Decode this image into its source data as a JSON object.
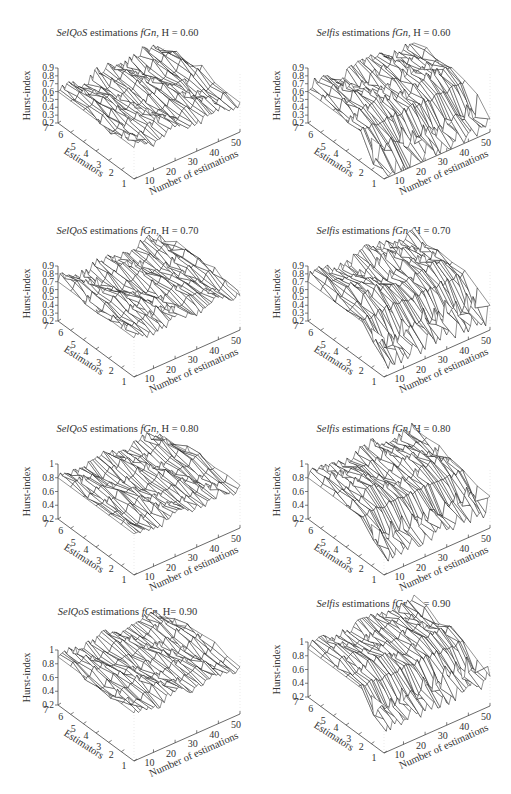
{
  "figure": {
    "common": {
      "zlabel": "Hurst-index",
      "ylabel": "Estimators",
      "xlabel": "Number of estimations",
      "x_ticks": [
        "10",
        "20",
        "30",
        "40",
        "50"
      ],
      "y_ticks": [
        "1",
        "2",
        "3",
        "4",
        "5",
        "6",
        "7"
      ],
      "title_suffix": "estimations",
      "title_series": "fGn",
      "title_h_prefix": "H"
    }
  },
  "panels": [
    {
      "id": "selqos-060",
      "tool": "SelQoS",
      "title_rest": " estimations ",
      "series": "fGn",
      "h_label": "H = 0.60",
      "z_ticks": [
        "0.2",
        "0.3",
        "0.4",
        "0.5",
        "0.6",
        "0.7",
        "0.8",
        "0.9"
      ]
    },
    {
      "id": "selfis-060",
      "tool": "Selfis",
      "title_rest": " estimations ",
      "series": "fGn",
      "h_label": "H = 0.60",
      "z_ticks": [
        "0.2",
        "0.3",
        "0.4",
        "0.5",
        "0.6",
        "0.7",
        "0.8",
        "0.9"
      ]
    },
    {
      "id": "selqos-070",
      "tool": "SelQoS",
      "title_rest": " estimations ",
      "series": "fGn",
      "h_label": "H = 0.70",
      "z_ticks": [
        "0.2",
        "0.3",
        "0.4",
        "0.5",
        "0.6",
        "0.7",
        "0.8",
        "0.9"
      ]
    },
    {
      "id": "selfis-070",
      "tool": "Selfis",
      "title_rest": " estimations ",
      "series": "fGn",
      "h_label": "H = 0.70",
      "z_ticks": [
        "0.2",
        "0.3",
        "0.4",
        "0.5",
        "0.6",
        "0.7",
        "0.8",
        "0.9"
      ]
    },
    {
      "id": "selqos-080",
      "tool": "SelQoS",
      "title_rest": " estimations ",
      "series": "fGn",
      "h_label": "H = 0.80",
      "z_ticks": [
        "0.2",
        "0.4",
        "0.6",
        "0.8",
        "1"
      ]
    },
    {
      "id": "selfis-080",
      "tool": "Selfis",
      "title_rest": " estimations ",
      "series": "fGn",
      "h_label": "H = 0.80",
      "z_ticks": [
        "0.2",
        "0.4",
        "0.6",
        "0.8",
        "1"
      ]
    },
    {
      "id": "selqos-090",
      "tool": "SelQoS",
      "title_rest": " estimations ",
      "series": "fGn",
      "h_label": "H= 0.90",
      "z_ticks": [
        "0.2",
        "0.4",
        "0.6",
        "0.8",
        "1"
      ]
    },
    {
      "id": "selfis-090",
      "tool": "Selfis",
      "title_rest": " estimations ",
      "series": "fGn",
      "h_label": "H = 0.90",
      "z_ticks": [
        "0.2",
        "0.4",
        "0.6",
        "0.8",
        "1"
      ]
    }
  ],
  "chart_data": [
    {
      "type": "surface",
      "title": "SelQoS estimations fGn, H = 0.60",
      "xlabel": "Number of estimations",
      "ylabel": "Estimators",
      "zlabel": "Hurst-index",
      "x_range": [
        1,
        50
      ],
      "x_ticks": [
        10,
        20,
        30,
        40,
        50
      ],
      "y_range": [
        1,
        7
      ],
      "y_ticks": [
        1,
        2,
        3,
        4,
        5,
        6,
        7
      ],
      "zlim": [
        0.2,
        0.9
      ],
      "z_ticks": [
        0.2,
        0.3,
        0.4,
        0.5,
        0.6,
        0.7,
        0.8,
        0.9
      ],
      "true_H": 0.6,
      "surface_level_approx": 0.6,
      "variation_approx": 0.08,
      "description": "Near-flat wireframe around 0.6 across all 7 estimators and 50 estimations"
    },
    {
      "type": "surface",
      "title": "Selfis estimations fGn, H = 0.60",
      "xlabel": "Number of estimations",
      "ylabel": "Estimators",
      "zlabel": "Hurst-index",
      "x_range": [
        1,
        50
      ],
      "x_ticks": [
        10,
        20,
        30,
        40,
        50
      ],
      "y_range": [
        1,
        7
      ],
      "y_ticks": [
        1,
        2,
        3,
        4,
        5,
        6,
        7
      ],
      "zlim": [
        0.2,
        0.9
      ],
      "z_ticks": [
        0.2,
        0.3,
        0.4,
        0.5,
        0.6,
        0.7,
        0.8,
        0.9
      ],
      "true_H": 0.6,
      "surface_level_approx": 0.6,
      "low_estimator_dip_approx": 0.2,
      "description": "Surface near 0.6 for estimators 3-7; estimators 1-2 drop sharply with spiky values down to ~0.2"
    },
    {
      "type": "surface",
      "title": "SelQoS estimations fGn, H = 0.70",
      "xlabel": "Number of estimations",
      "ylabel": "Estimators",
      "zlabel": "Hurst-index",
      "x_range": [
        1,
        50
      ],
      "x_ticks": [
        10,
        20,
        30,
        40,
        50
      ],
      "y_range": [
        1,
        7
      ],
      "y_ticks": [
        1,
        2,
        3,
        4,
        5,
        6,
        7
      ],
      "zlim": [
        0.2,
        0.9
      ],
      "z_ticks": [
        0.2,
        0.3,
        0.4,
        0.5,
        0.6,
        0.7,
        0.8,
        0.9
      ],
      "true_H": 0.7,
      "surface_level_approx": 0.7,
      "variation_approx": 0.08,
      "description": "Near-flat wireframe around 0.7"
    },
    {
      "type": "surface",
      "title": "Selfis estimations fGn, H = 0.70",
      "xlabel": "Number of estimations",
      "ylabel": "Estimators",
      "zlabel": "Hurst-index",
      "x_range": [
        1,
        50
      ],
      "x_ticks": [
        10,
        20,
        30,
        40,
        50
      ],
      "y_range": [
        1,
        7
      ],
      "y_ticks": [
        1,
        2,
        3,
        4,
        5,
        6,
        7
      ],
      "zlim": [
        0.2,
        0.9
      ],
      "z_ticks": [
        0.2,
        0.3,
        0.4,
        0.5,
        0.6,
        0.7,
        0.8,
        0.9
      ],
      "true_H": 0.7,
      "surface_level_approx": 0.7,
      "low_estimator_dip_approx": 0.25,
      "description": "Surface near 0.7; estimators 1-2 spike down to ~0.25"
    },
    {
      "type": "surface",
      "title": "SelQoS estimations fGn, H = 0.80",
      "xlabel": "Number of estimations",
      "ylabel": "Estimators",
      "zlabel": "Hurst-index",
      "x_range": [
        1,
        50
      ],
      "x_ticks": [
        10,
        20,
        30,
        40,
        50
      ],
      "y_range": [
        1,
        7
      ],
      "y_ticks": [
        1,
        2,
        3,
        4,
        5,
        6,
        7
      ],
      "zlim": [
        0.2,
        1.0
      ],
      "z_ticks": [
        0.2,
        0.4,
        0.6,
        0.8,
        1.0
      ],
      "true_H": 0.8,
      "surface_level_approx": 0.8,
      "variation_approx": 0.1,
      "description": "Near-flat wireframe around 0.8"
    },
    {
      "type": "surface",
      "title": "Selfis estimations fGn, H = 0.80",
      "xlabel": "Number of estimations",
      "ylabel": "Estimators",
      "zlabel": "Hurst-index",
      "x_range": [
        1,
        50
      ],
      "x_ticks": [
        10,
        20,
        30,
        40,
        50
      ],
      "y_range": [
        1,
        7
      ],
      "y_ticks": [
        1,
        2,
        3,
        4,
        5,
        6,
        7
      ],
      "zlim": [
        0.2,
        1.0
      ],
      "z_ticks": [
        0.2,
        0.4,
        0.6,
        0.8,
        1.0
      ],
      "true_H": 0.8,
      "surface_level_approx": 0.8,
      "low_estimator_dip_approx": 0.3,
      "description": "Surface near 0.8; estimators 1-2 spike down to ~0.3"
    },
    {
      "type": "surface",
      "title": "SelQoS estimations fGn, H = 0.90",
      "xlabel": "Number of estimations",
      "ylabel": "Estimators",
      "zlabel": "Hurst-index",
      "x_range": [
        1,
        50
      ],
      "x_ticks": [
        10,
        20,
        30,
        40,
        50
      ],
      "y_range": [
        1,
        7
      ],
      "y_ticks": [
        1,
        2,
        3,
        4,
        5,
        6,
        7
      ],
      "zlim": [
        0.2,
        1.0
      ],
      "z_ticks": [
        0.2,
        0.4,
        0.6,
        0.8,
        1.0
      ],
      "true_H": 0.9,
      "surface_level_approx": 0.9,
      "variation_approx": 0.1,
      "description": "Near-flat wireframe around 0.9"
    },
    {
      "type": "surface",
      "title": "Selfis estimations fGn, H = 0.90",
      "xlabel": "Number of estimations",
      "ylabel": "Estimators",
      "zlabel": "Hurst-index",
      "x_range": [
        1,
        50
      ],
      "x_ticks": [
        10,
        20,
        30,
        40,
        50
      ],
      "y_range": [
        1,
        7
      ],
      "y_ticks": [
        1,
        2,
        3,
        4,
        5,
        6,
        7
      ],
      "zlim": [
        0.2,
        1.0
      ],
      "z_ticks": [
        0.2,
        0.4,
        0.6,
        0.8,
        1.0
      ],
      "true_H": 0.9,
      "surface_level_approx": 0.9,
      "low_estimator_dip_approx": 0.35,
      "description": "Surface near 0.9; estimators 1-2 spike down to ~0.35"
    }
  ]
}
